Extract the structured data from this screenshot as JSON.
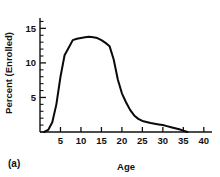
{
  "chart_data": {
    "type": "line",
    "title": "",
    "panel_label": "(a)",
    "xlabel": "Age",
    "ylabel": "Percent (Enrolled)",
    "xlim": [
      0,
      42
    ],
    "ylim": [
      0,
      16.5
    ],
    "xticks": [
      5,
      10,
      15,
      20,
      25,
      30,
      35,
      40
    ],
    "yticks": [
      5,
      10,
      15
    ],
    "x_minor_step": 1,
    "y_minor_step": 1,
    "grid": false,
    "legend": null,
    "x": [
      1,
      2,
      3,
      4,
      5,
      6,
      7,
      8,
      9,
      10,
      11,
      12,
      13,
      14,
      15,
      16,
      17,
      18,
      19,
      20,
      21,
      22,
      23,
      24,
      25,
      26,
      27,
      28,
      29,
      30,
      31,
      32,
      33,
      34,
      35,
      36
    ],
    "values": [
      0.0,
      0.3,
      1.4,
      4.0,
      8.0,
      11.1,
      12.2,
      13.3,
      13.5,
      13.6,
      13.7,
      13.8,
      13.7,
      13.6,
      13.3,
      12.9,
      12.4,
      10.5,
      7.6,
      5.6,
      4.3,
      3.2,
      2.4,
      1.9,
      1.6,
      1.45,
      1.3,
      1.2,
      1.1,
      1.0,
      0.85,
      0.7,
      0.55,
      0.4,
      0.2,
      0.0
    ],
    "series_name": "Percent Enrolled"
  },
  "ticks": {
    "x": [
      "5",
      "10",
      "15",
      "20",
      "25",
      "30",
      "35",
      "40"
    ],
    "y": [
      "5",
      "10",
      "15"
    ]
  },
  "labels": {
    "xlabel": "Age",
    "ylabel": "Percent (Enrolled)",
    "panel": "(a)"
  },
  "colors": {
    "curve": "#0a0a0a",
    "axis": "#111111",
    "background": "#ffffff"
  }
}
